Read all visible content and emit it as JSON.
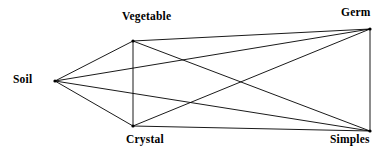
{
  "diagram": {
    "type": "node-link-graph",
    "background_color": "#ffffff",
    "line_color": "#000000",
    "label_color": "#000000",
    "nodes": [
      {
        "id": "soil",
        "label": "Soil",
        "x": 55,
        "y": 81,
        "label_position": "left"
      },
      {
        "id": "vegetable",
        "label": "Vegetable",
        "x": 133,
        "y": 41,
        "label_position": "above"
      },
      {
        "id": "germ",
        "label": "Germ",
        "x": 370,
        "y": 29,
        "label_position": "above"
      },
      {
        "id": "crystal",
        "label": "Crystal",
        "x": 133,
        "y": 126,
        "label_position": "below"
      },
      {
        "id": "simples",
        "label": "Simples",
        "x": 370,
        "y": 131,
        "label_position": "below"
      }
    ],
    "edges": [
      {
        "from": "soil",
        "to": "vegetable"
      },
      {
        "from": "soil",
        "to": "germ"
      },
      {
        "from": "soil",
        "to": "simples"
      },
      {
        "from": "soil",
        "to": "crystal"
      },
      {
        "from": "vegetable",
        "to": "germ"
      },
      {
        "from": "vegetable",
        "to": "crystal"
      },
      {
        "from": "vegetable",
        "to": "simples"
      },
      {
        "from": "crystal",
        "to": "germ"
      },
      {
        "from": "crystal",
        "to": "simples"
      },
      {
        "from": "germ",
        "to": "simples"
      }
    ]
  }
}
